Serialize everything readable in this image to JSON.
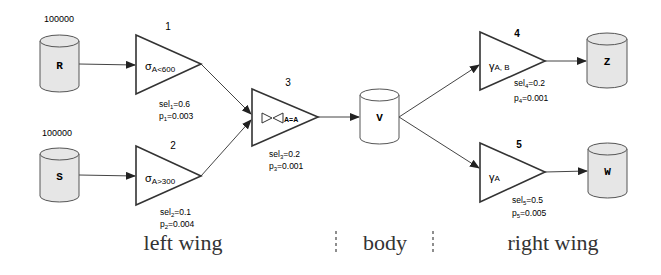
{
  "diagram": {
    "sources": [
      {
        "id": "R",
        "label": "R",
        "count": "100000",
        "shaded": true
      },
      {
        "id": "S",
        "label": "S",
        "count": "100000",
        "shaded": true
      }
    ],
    "view": {
      "id": "V",
      "label": "V",
      "shaded": false
    },
    "targets": [
      {
        "id": "Z",
        "label": "Z",
        "shaded": true
      },
      {
        "id": "W",
        "label": "W",
        "shaded": true
      }
    ],
    "operators": [
      {
        "num": "1",
        "op": "σ",
        "sub": "A<600",
        "sel_label": "sel",
        "sel_sub": "1",
        "sel_val": "=0.6",
        "p_label": "p",
        "p_sub": "1",
        "p_val": "=0.003"
      },
      {
        "num": "2",
        "op": "σ",
        "sub": "A>300",
        "sel_label": "sel",
        "sel_sub": "2",
        "sel_val": "=0.1",
        "p_label": "p",
        "p_sub": "2",
        "p_val": "=0.004"
      },
      {
        "num": "3",
        "op": "⋈",
        "sub": "A=A",
        "sel_label": "sel",
        "sel_sub": "3",
        "sel_val": "=0.2",
        "p_label": "p",
        "p_sub": "3",
        "p_val": "=0.001"
      },
      {
        "num": "4",
        "op": "γ",
        "sub": "A, B",
        "sel_label": "sel",
        "sel_sub": "4",
        "sel_val": "=0.2",
        "p_label": "p",
        "p_sub": "4",
        "p_val": "=0.001"
      },
      {
        "num": "5",
        "op": "γ",
        "sub": "A",
        "sel_label": "sel",
        "sel_sub": "5",
        "sel_val": "=0.5",
        "p_label": "p",
        "p_sub": "5",
        "p_val": "=0.005"
      }
    ],
    "sections": {
      "left": "left wing",
      "body": "body",
      "right": "right wing"
    },
    "colors": {
      "stroke": "#333333",
      "shaded_fill": "#e6e6e6",
      "white_fill": "#ffffff",
      "edge": "#555555"
    }
  }
}
